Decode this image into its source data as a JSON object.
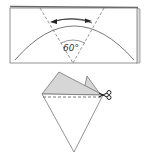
{
  "diagram": {
    "type": "origami-folding-instructions",
    "step1": {
      "description": "Folded paper rectangle with 60 degree fold guides",
      "angle_label": "60°",
      "colors": {
        "line": "#555555",
        "edge_shade": "#d9d9d9"
      }
    },
    "step2": {
      "description": "Folded cone shape with shaded flaps and cut line",
      "cut_line": "dashed",
      "tool_icon": "scissors-icon",
      "colors": {
        "flap_fill": "#d6d6d6",
        "line": "#555555"
      }
    }
  }
}
